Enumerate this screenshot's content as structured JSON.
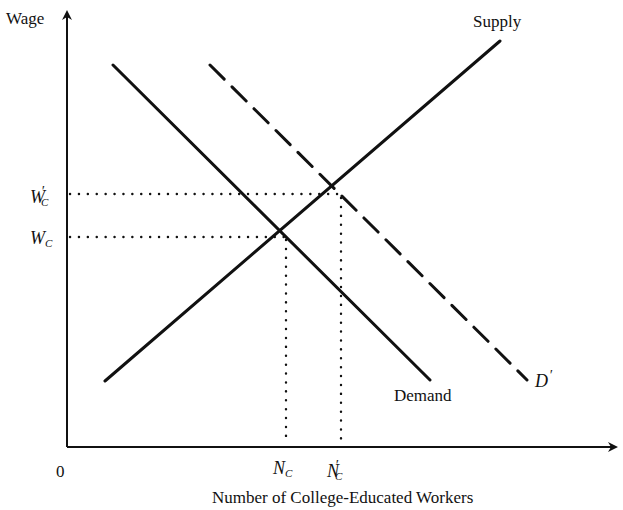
{
  "diagram": {
    "title": "",
    "y_axis": {
      "label": "Wage"
    },
    "x_axis": {
      "label": "Number of College-Educated Workers",
      "origin": "0"
    },
    "curves": {
      "supply": {
        "label": "Supply"
      },
      "demand": {
        "label": "Demand"
      },
      "shifted_demand": {
        "label": "D",
        "prime": "′"
      }
    },
    "wage_levels": [
      {
        "main": "W",
        "sub": "C",
        "prime": "′"
      },
      {
        "main": "W",
        "sub": "C",
        "prime": ""
      }
    ],
    "quantity_levels": [
      {
        "main": "N",
        "sub": "C",
        "prime": ""
      },
      {
        "main": "N",
        "sub": "C",
        "prime": "′"
      }
    ],
    "colors": {
      "line": "#111111",
      "background": "#ffffff"
    }
  }
}
